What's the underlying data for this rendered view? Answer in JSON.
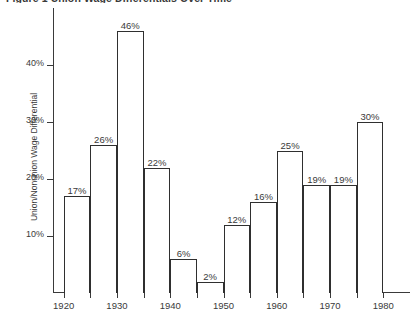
{
  "chart_data": {
    "type": "bar",
    "title": "Figure 1  Union Wage Differentials Over Time",
    "xlabel": "",
    "ylabel": "Union/Nonunion Wage Differential",
    "categories": [
      "1920",
      "1925",
      "1930",
      "1935",
      "1940",
      "1945",
      "1950",
      "1955",
      "1960",
      "1965",
      "1970",
      "1975"
    ],
    "values": [
      17,
      26,
      46,
      22,
      6,
      2,
      12,
      16,
      25,
      19,
      19,
      30
    ],
    "value_labels": [
      "17%",
      "26%",
      "46%",
      "22%",
      "6%",
      "2%",
      "12%",
      "16%",
      "25%",
      "19%",
      "19%",
      "30%"
    ],
    "bar_spans": [
      {
        "start": "1920",
        "end": "1925"
      },
      {
        "start": "1925",
        "end": "1930"
      },
      {
        "start": "1930",
        "end": "1935"
      },
      {
        "start": "1935",
        "end": "1940"
      },
      {
        "start": "1940",
        "end": "1945"
      },
      {
        "start": "1945",
        "end": "1950"
      },
      {
        "start": "1950",
        "end": "1955"
      },
      {
        "start": "1955",
        "end": "1960"
      },
      {
        "start": "1960",
        "end": "1965"
      },
      {
        "start": "1965",
        "end": "1970"
      },
      {
        "start": "1970",
        "end": "1975"
      },
      {
        "start": "1975",
        "end": "1980"
      }
    ],
    "ylim": [
      0,
      50
    ],
    "yticks": [
      10,
      20,
      30,
      40
    ],
    "ytick_labels": [
      "10%",
      "20%",
      "30%",
      "40%"
    ],
    "xlim": [
      1918,
      1985
    ],
    "xticks": [
      1920,
      1925,
      1930,
      1935,
      1940,
      1945,
      1950,
      1955,
      1960,
      1965,
      1970,
      1975,
      1980
    ],
    "xtick_labels": [
      "1920",
      "",
      "1930",
      "",
      "1940",
      "",
      "1950",
      "",
      "1960",
      "",
      "1970",
      "",
      "1980"
    ],
    "grid": false,
    "legend": null,
    "bar_fill": "#ffffff",
    "bar_edge": "#2f2f2f",
    "axis_color": "#3a3a3a",
    "text_color": "#3a3a3a",
    "background": "#ffffff"
  }
}
